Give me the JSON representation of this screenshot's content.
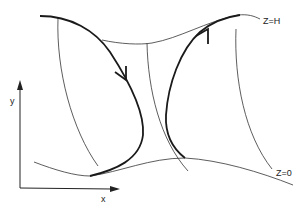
{
  "diagram": {
    "labels": {
      "top_surface": "Z=H",
      "bottom_surface": "Z=0",
      "x_axis": "x",
      "y_axis": "y"
    },
    "colors": {
      "background": "#ffffff",
      "line": "#1a1a1a"
    },
    "elements": {
      "surfaces": [
        "Z=H",
        "Z=0"
      ],
      "trajectories": [
        {
          "name": "left-trajectory",
          "direction": "downward"
        },
        {
          "name": "right-trajectory",
          "direction": "upward"
        }
      ],
      "vertical_lines": 3
    }
  }
}
